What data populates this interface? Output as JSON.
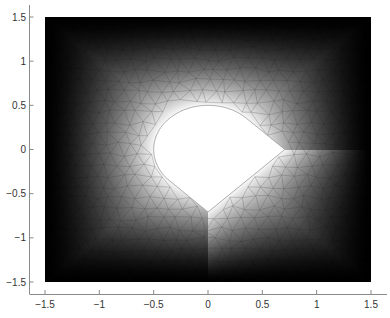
{
  "chart_data": {
    "type": "heatmap",
    "title": "",
    "xlabel": "",
    "ylabel": "",
    "xlim": [
      -1.5,
      1.5
    ],
    "ylim": [
      -1.5,
      1.5
    ],
    "xticks": [
      -1.5,
      -1,
      -0.5,
      0,
      0.5,
      1,
      1.5
    ],
    "xtick_labels": [
      "-1.5",
      "-1",
      "-0.5",
      "0",
      "0.5",
      "1",
      "1.5"
    ],
    "yticks": [
      1.5,
      1,
      0.5,
      0,
      -0.5,
      -1,
      -1.5
    ],
    "ytick_labels": [
      "1.5",
      "1",
      "0.5",
      "0",
      "-0.5",
      "-1",
      "-1.5"
    ],
    "grid": false,
    "colormap": "gray",
    "colormap_low": "#000000",
    "colormap_high": "#ffffff",
    "mesh": "triangular",
    "domain": {
      "outer": "square [-1.5,1.5] x [-1.5,1.5]",
      "hole": {
        "circle_center": [
          0,
          0
        ],
        "circle_radius": 0.5,
        "corner_points": [
          [
            0.707,
            0
          ],
          [
            0,
            -0.707
          ]
        ]
      }
    },
    "field_description": "Solution value 1 (white) on hole boundary decaying to 0 (black) on outer square boundary"
  }
}
